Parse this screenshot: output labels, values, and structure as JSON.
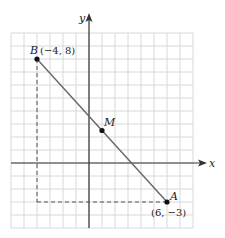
{
  "diagram": {
    "type": "coordinate-plane",
    "grid": {
      "x_min": -6,
      "x_max": 8,
      "y_min": -5,
      "y_max": 10,
      "step": 1
    },
    "axes": {
      "x_label": "x",
      "y_label": "y"
    },
    "points": [
      {
        "name": "B",
        "x": -4,
        "y": 8,
        "coord_label": "(−4, 8)"
      },
      {
        "name": "M",
        "x": 1,
        "y": 2.5,
        "coord_label": ""
      },
      {
        "name": "A",
        "x": 6,
        "y": -3,
        "coord_label": "(6, −3)"
      }
    ],
    "segment": {
      "from": "B",
      "to": "A"
    },
    "dashed_guides": [
      {
        "from": [
          -4,
          8
        ],
        "to": [
          -4,
          -3
        ]
      },
      {
        "from": [
          -4,
          -3
        ],
        "to": [
          6,
          -3
        ]
      }
    ],
    "colors": {
      "grid": "#d8d8d8",
      "axis": "#333333",
      "segment": "#555555",
      "point": "#111111"
    }
  },
  "labels": {
    "x_axis": "x",
    "y_axis": "y",
    "point_b": "B",
    "point_b_coord": "(−4, 8)",
    "point_m": "M",
    "point_a": "A",
    "point_a_coord": "(6, −3)"
  }
}
